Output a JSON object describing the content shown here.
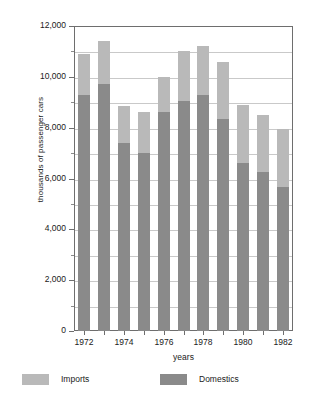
{
  "chart_data": {
    "type": "bar",
    "subtype": "stacked-vertical-bar",
    "title": "",
    "xlabel": "years",
    "ylabel": "thousands of passenger cars",
    "categories": [
      "1972",
      "1973",
      "1974",
      "1975",
      "1976",
      "1977",
      "1978",
      "1979",
      "1980",
      "1981",
      "1982"
    ],
    "x_tick_labels": [
      "1972",
      "1974",
      "1976",
      "1978",
      "1980",
      "1982"
    ],
    "x_tick_categories": [
      "1972",
      "1974",
      "1976",
      "1978",
      "1980",
      "1982"
    ],
    "y_tick_labels": [
      "0",
      "2,000",
      "4,000",
      "6,000",
      "8,000",
      "10,000",
      "12,000"
    ],
    "y_tick_values": [
      0,
      2000,
      4000,
      6000,
      8000,
      10000,
      12000
    ],
    "y_minor_tick_values": [
      1000,
      3000,
      5000,
      7000,
      9000,
      11000
    ],
    "ylim": [
      0,
      12000
    ],
    "grid": true,
    "grid_axis": "y",
    "legend_position": "bottom-left",
    "series": [
      {
        "name": "Domestics",
        "color": "#8a8a8a",
        "values": [
          9300,
          9700,
          7400,
          7000,
          8600,
          9050,
          9300,
          8350,
          6600,
          6250,
          5650
        ]
      },
      {
        "name": "Imports",
        "color": "#b9b9b9",
        "values": [
          1600,
          1700,
          1450,
          1600,
          1400,
          1950,
          1900,
          2250,
          2300,
          2250,
          2300
        ]
      }
    ],
    "totals": [
      10900,
      11400,
      8850,
      8600,
      10000,
      11000,
      11200,
      10600,
      8900,
      8500,
      7950
    ]
  },
  "legend": {
    "items": [
      {
        "label": "Imports",
        "color": "#b9b9b9"
      },
      {
        "label": "Domestics",
        "color": "#8a8a8a"
      }
    ]
  },
  "colors": {
    "imports": "#b9b9b9",
    "domestics": "#8a8a8a",
    "grid": "#c9c9c9",
    "axis": "#6e6e6e",
    "background": "#ffffff",
    "text": "#1a1a1a"
  }
}
